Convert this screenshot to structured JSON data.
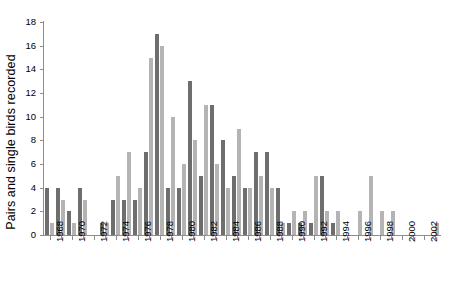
{
  "chart_data": {
    "type": "bar",
    "title": "",
    "xlabel": "",
    "ylabel": "Pairs and single birds recorded",
    "ylim": [
      0,
      18
    ],
    "ytick_values": [
      0,
      2,
      4,
      6,
      8,
      10,
      12,
      14,
      16,
      18
    ],
    "ytick_labels": [
      "0",
      "2",
      "4",
      "6",
      "8",
      "10",
      "12",
      "14",
      "16",
      "18"
    ],
    "grid": false,
    "legend": "none",
    "xlim_labels": [
      "1968",
      "2003"
    ],
    "categories": [
      "1968",
      "1969",
      "1970",
      "1971",
      "1972",
      "1973",
      "1974",
      "1975",
      "1976",
      "1977",
      "1978",
      "1979",
      "1980",
      "1981",
      "1982",
      "1983",
      "1984",
      "1985",
      "1986",
      "1987",
      "1988",
      "1989",
      "1990",
      "1991",
      "1992",
      "1993",
      "1994",
      "1995",
      "1996",
      "1997",
      "1998",
      "1999",
      "2000",
      "2001",
      "2002",
      "2003"
    ],
    "xtick_labels": [
      "1968",
      "1970",
      "1972",
      "1974",
      "1976",
      "1978",
      "1980",
      "1982",
      "1984",
      "1986",
      "1988",
      "1990",
      "1992",
      "1994",
      "1996",
      "1998",
      "2000",
      "2002"
    ],
    "series": [
      {
        "name": "pairs",
        "color": "#6e6e6e",
        "values": [
          4,
          4,
          2,
          4,
          0,
          1,
          3,
          3,
          3,
          7,
          17,
          4,
          4,
          13,
          5,
          11,
          8,
          5,
          4,
          7,
          7,
          4,
          1,
          1,
          1,
          5,
          1,
          0,
          0,
          0,
          0,
          0,
          0,
          0,
          0,
          0
        ]
      },
      {
        "name": "single-birds",
        "color": "#b4b4b4",
        "values": [
          1,
          3,
          1,
          3,
          0,
          1,
          5,
          7,
          4,
          15,
          16,
          10,
          6,
          8,
          11,
          6,
          4,
          9,
          4,
          5,
          4,
          1,
          2,
          2,
          5,
          2,
          2,
          0,
          2,
          5,
          2,
          2,
          0,
          0,
          0,
          1
        ]
      }
    ]
  }
}
